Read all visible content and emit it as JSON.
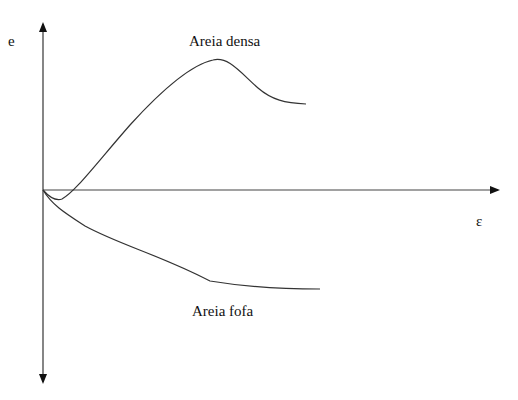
{
  "diagram": {
    "y_axis_label": "e",
    "x_axis_label": "ε",
    "curves": [
      {
        "name": "dense-sand",
        "label": "Areia densa"
      },
      {
        "name": "loose-sand",
        "label": "Areia fofa"
      }
    ],
    "colors": {
      "line": "#333333",
      "axis": "#222222"
    }
  }
}
